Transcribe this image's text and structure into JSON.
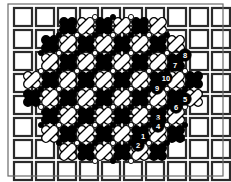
{
  "figure": {
    "canvas": {
      "width": 231,
      "height": 182
    },
    "colors": {
      "background": "#ffffff",
      "grid_line": "#2b2b2b",
      "frame": "#6b6b6b",
      "capsule_dark": "#000000",
      "capsule_light": "#ffffff",
      "capsule_outline": "#000000",
      "label_fill": "#000000",
      "label_text": "#ffffff",
      "node_light": "#ffffff",
      "node_dark": "#000000"
    },
    "grid": {
      "columns": 11,
      "rows": 9,
      "cell_size": 18,
      "gap": 4,
      "origin_x": 14,
      "origin_y": 8,
      "line_width": 2.2
    },
    "lattice": {
      "step": 18,
      "origin_x": 23,
      "origin_y": 17,
      "cols": 11,
      "rows": 9,
      "capsule_length": 20,
      "capsule_width": 8.5,
      "note": "capsules run along the two diagonal directions between lattice nodes"
    },
    "labels": [
      {
        "id": "8",
        "text": "8",
        "x": 185,
        "y": 55
      },
      {
        "id": "7",
        "text": "7",
        "x": 175,
        "y": 65
      },
      {
        "id": "10",
        "text": "10",
        "x": 166,
        "y": 78
      },
      {
        "id": "9",
        "text": "9",
        "x": 157,
        "y": 88
      },
      {
        "id": "5",
        "text": "5",
        "x": 185,
        "y": 99
      },
      {
        "id": "6",
        "text": "6",
        "x": 176,
        "y": 107
      },
      {
        "id": "3",
        "text": "3",
        "x": 158,
        "y": 117
      },
      {
        "id": "4",
        "text": "4",
        "x": 158,
        "y": 126
      },
      {
        "id": "1",
        "text": "1",
        "x": 143,
        "y": 136
      },
      {
        "id": "2",
        "text": "2",
        "x": 138,
        "y": 145
      }
    ],
    "label_radius": 6.2,
    "label_font_size": 7.5
  }
}
